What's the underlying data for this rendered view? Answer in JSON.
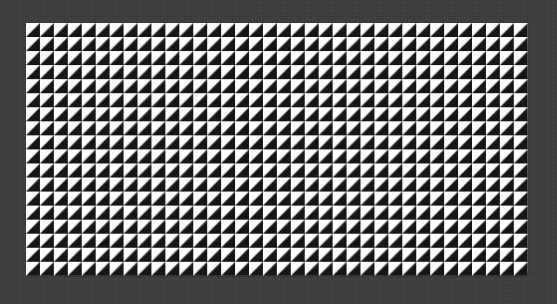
{
  "canvas": {
    "background_color": "#3c3c3c"
  },
  "pattern": {
    "description": "Grid of squares split diagonally: white upper-left triangle, black lower-right triangle",
    "columns": 36,
    "rows": 18,
    "tile_size_px": 14,
    "light_color": "#ffffff",
    "dark_color": "#161616",
    "diagonal": "bottom-left to top-right"
  }
}
